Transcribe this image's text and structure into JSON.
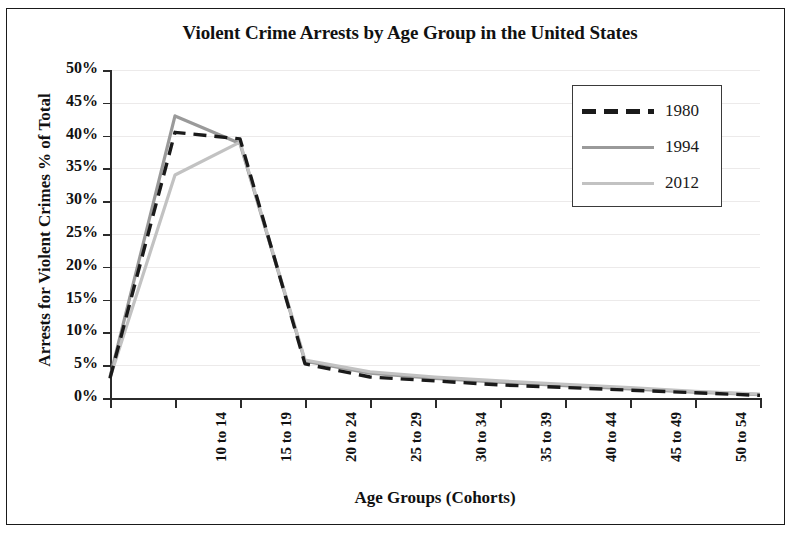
{
  "figure": {
    "title": "Violent Crime Arrests by Age Group in the United States",
    "x_axis_title": "Age Groups (Cohorts)",
    "y_axis_title": "Arrests for Violent Crimes % of Total"
  },
  "legend": {
    "entries": [
      {
        "label": "1980",
        "color": "#1a1a1a",
        "style": "dashed"
      },
      {
        "label": "1994",
        "color": "#9a9a9a",
        "style": "solid"
      },
      {
        "label": "2012",
        "color": "#c2c2c2",
        "style": "solid"
      }
    ]
  },
  "axes": {
    "y_ticks": [
      "50%",
      "45%",
      "40%",
      "35%",
      "30%",
      "25%",
      "20%",
      "15%",
      "10%",
      "5%",
      "0%"
    ],
    "x_ticks": [
      "10 to 14",
      "15 to 19",
      "20 to 24",
      "25 to 29",
      "30 to 34",
      "35 to 39",
      "40 to 44",
      "45 to 49",
      "50 to 54",
      "55 to 59",
      "60 to 64"
    ]
  },
  "chart_data": {
    "type": "line",
    "title": "Violent Crime Arrests by Age Group in the United States",
    "xlabel": "Age Groups (Cohorts)",
    "ylabel": "Arrests for Violent Crimes % of Total",
    "categories": [
      "10 to 14",
      "15 to 19",
      "20 to 24",
      "25 to 29",
      "30 to 34",
      "35 to 39",
      "40 to 44",
      "45 to 49",
      "50 to 54",
      "55 to 59",
      "60 to 64"
    ],
    "ylim": [
      0,
      50
    ],
    "ytick_step": 5,
    "yunit": "%",
    "grid": true,
    "legend_position": "top-right",
    "series": [
      {
        "name": "1980",
        "color": "#1a1a1a",
        "style": "dashed",
        "values": [
          3.0,
          40.5,
          39.5,
          5.2,
          3.2,
          2.6,
          2.0,
          1.6,
          1.2,
          0.8,
          0.4
        ]
      },
      {
        "name": "1994",
        "color": "#9a9a9a",
        "style": "solid",
        "values": [
          3.2,
          43.0,
          38.8,
          5.6,
          3.8,
          3.0,
          2.4,
          1.9,
          1.4,
          0.9,
          0.5
        ]
      },
      {
        "name": "2012",
        "color": "#c2c2c2",
        "style": "solid",
        "values": [
          3.1,
          34.0,
          39.0,
          5.8,
          4.0,
          3.2,
          2.6,
          2.1,
          1.6,
          1.0,
          0.6
        ]
      }
    ]
  }
}
